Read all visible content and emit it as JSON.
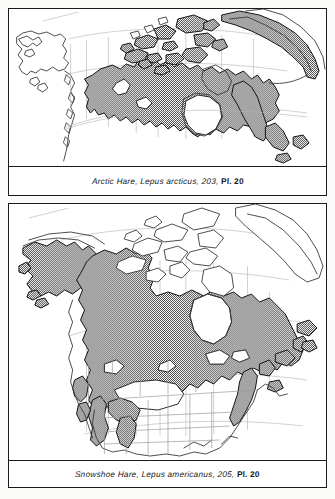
{
  "page": {
    "background": "#fbfbfa",
    "frame_color": "#1a1a1a"
  },
  "panels": [
    {
      "id": "arctic-hare",
      "map_name": "north-america-arctic-range-map",
      "caption": {
        "common_name": "Arctic Hare,",
        "scientific_name": "Lepus arcticus,",
        "page_number": "203,",
        "plate": "Pl. 20",
        "full_text": "Arctic Hare, Lepus arcticus, 203, Pl. 20"
      },
      "range_shading": "stipple-gray",
      "shading_color": "#8c8c8c"
    },
    {
      "id": "snowshoe-hare",
      "map_name": "north-america-snowshoe-range-map",
      "caption": {
        "common_name": "Snowshoe Hare,",
        "scientific_name": "Lepus americanus,",
        "page_number": "205,",
        "plate": "Pl. 20",
        "full_text": "Snowshoe Hare, Lepus americanus, 205, Pl. 20"
      },
      "range_shading": "stipple-gray",
      "shading_color": "#8c8c8c"
    }
  ]
}
